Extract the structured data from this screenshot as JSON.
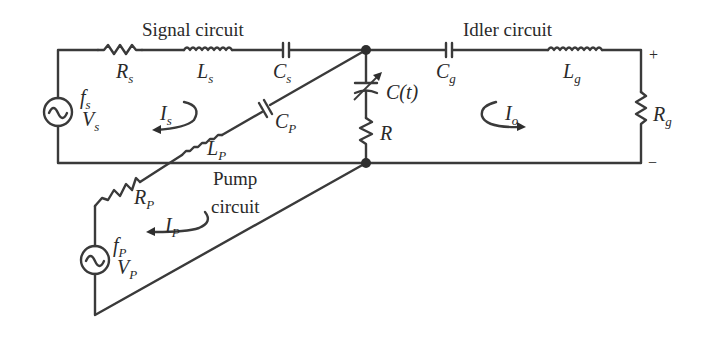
{
  "diagram": {
    "type": "circuit-schematic",
    "titles": {
      "signal": "Signal circuit",
      "idler": "Idler circuit",
      "pump_line1": "Pump",
      "pump_line2": "circuit"
    },
    "components": {
      "Rs": {
        "base": "R",
        "sub": "s"
      },
      "Ls": {
        "base": "L",
        "sub": "s"
      },
      "Cs": {
        "base": "C",
        "sub": "s"
      },
      "Cg": {
        "base": "C",
        "sub": "g"
      },
      "Lg": {
        "base": "L",
        "sub": "g"
      },
      "Rg": {
        "base": "R",
        "sub": "g"
      },
      "Ct": {
        "label": "C(t)"
      },
      "R": {
        "label": "R"
      },
      "Cp": {
        "base": "C",
        "sub": "P"
      },
      "Lp": {
        "base": "L",
        "sub": "P"
      },
      "Rp": {
        "base": "R",
        "sub": "P"
      }
    },
    "sources": {
      "signal": {
        "f_base": "f",
        "f_sub": "s",
        "v_base": "V",
        "v_sub": "s"
      },
      "pump": {
        "f_base": "f",
        "f_sub": "P",
        "v_base": "V",
        "v_sub": "P"
      }
    },
    "currents": {
      "Is": {
        "base": "I",
        "sub": "s"
      },
      "Io": {
        "base": "I",
        "sub": "o"
      },
      "Ip": {
        "base": "I",
        "sub": "P"
      }
    },
    "terminals": {
      "plus": "+",
      "minus": "−"
    },
    "colors": {
      "ink": "#3a3a3a",
      "background": "#ffffff"
    }
  }
}
